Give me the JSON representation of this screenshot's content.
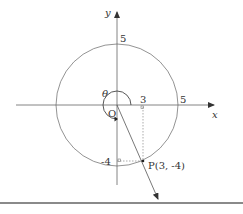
{
  "diagram": {
    "axes": {
      "x_label": "x",
      "y_label": "y",
      "origin_label": "O"
    },
    "circle": {
      "radius_value": 5,
      "x_intercept_label": "5",
      "y_intercept_label": "5"
    },
    "point": {
      "label": "P(3, -4)",
      "x": 3,
      "y": -4
    },
    "projections": {
      "x_tick_label": "3",
      "y_tick_label": "-4"
    },
    "angle": {
      "label": "θ"
    },
    "colors": {
      "line": "#555555",
      "text": "#333333",
      "rule": "#8a8a8a"
    }
  }
}
